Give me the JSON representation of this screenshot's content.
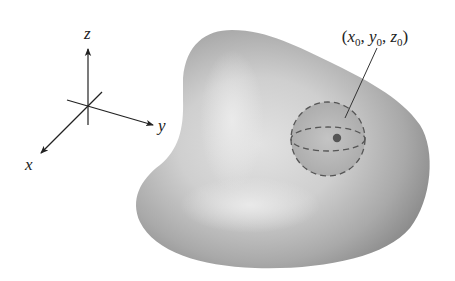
{
  "figure": {
    "type": "3d-solid-region-with-ball",
    "axes": {
      "x_label": "x",
      "y_label": "y",
      "z_label": "z"
    },
    "point_label": {
      "open": "(",
      "x": "x",
      "x_sub": "0",
      "sep1": ", ",
      "y": "y",
      "y_sub": "0",
      "sep2": ", ",
      "z": "z",
      "z_sub": "0",
      "close": ")"
    },
    "colors": {
      "blob_edge": "#8f8f8f",
      "blob_highlight": "#dcdcdc",
      "sphere_fill": "#b7b7b7",
      "dashes": "#555555",
      "point": "#555555",
      "axes": "#222222"
    }
  }
}
